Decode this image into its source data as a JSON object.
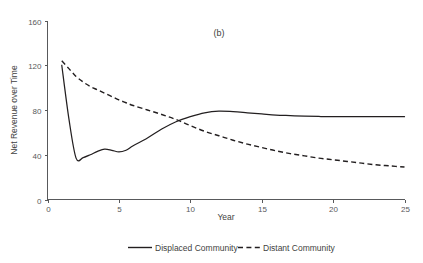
{
  "figure": {
    "panel_label": "(b)",
    "background": "#ffffff",
    "ink_color": "#231f20",
    "axis_color": "#58595b"
  },
  "chart_data": {
    "type": "line",
    "title": "(b)",
    "xlabel": "Year",
    "ylabel": "Net Revenue over Time",
    "xlim": [
      0,
      25
    ],
    "ylim": [
      0,
      160
    ],
    "xticks": [
      0,
      5,
      10,
      15,
      20,
      25
    ],
    "yticks": [
      0,
      40,
      80,
      120,
      160
    ],
    "grid": false,
    "legend_position": "bottom",
    "x": [
      1,
      1.5,
      2,
      2.5,
      3,
      3.5,
      4,
      4.5,
      5,
      5.5,
      6,
      7,
      8,
      9,
      10,
      11,
      12,
      13,
      14,
      15,
      16,
      17,
      18,
      19,
      20,
      21,
      22,
      23,
      24,
      25
    ],
    "series": [
      {
        "name": "Displaced Community",
        "style": "solid",
        "color": "#231f20",
        "values": [
          120,
          72,
          37,
          37.5,
          40,
          43,
          45,
          44,
          42.5,
          44,
          48,
          55,
          63,
          69.5,
          74,
          77.5,
          79,
          78.5,
          77.5,
          76.5,
          75.5,
          75,
          74.5,
          74.2,
          74,
          74,
          74,
          74,
          74,
          74
        ]
      },
      {
        "name": "Distant Community",
        "style": "dashed",
        "color": "#231f20",
        "values": [
          124,
          117,
          110,
          105,
          101,
          98,
          95,
          92,
          89,
          86.5,
          84,
          80,
          76,
          71.5,
          66,
          61,
          57,
          53,
          49.5,
          46.5,
          43.5,
          41,
          39,
          37,
          35.5,
          34,
          32.5,
          31,
          30,
          29
        ]
      }
    ],
    "annotations": [
      {
        "text": "crossover",
        "x": 8.6,
        "y": 72
      }
    ]
  },
  "legend": {
    "items": [
      {
        "label": "Displaced Community",
        "style": "solid"
      },
      {
        "label": "Distant Community",
        "style": "dashed"
      }
    ]
  },
  "axis_labels": {
    "x_title": "Year",
    "y_title": "Net Revenue over Time",
    "x_ticks": [
      "0",
      "5",
      "10",
      "15",
      "20",
      "25"
    ],
    "y_ticks": [
      "0",
      "40",
      "80",
      "120",
      "160"
    ]
  }
}
